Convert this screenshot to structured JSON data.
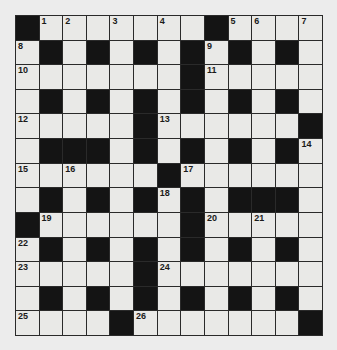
{
  "puzzle": {
    "rows": 13,
    "cols": 13,
    "colors": {
      "background": "#ececec",
      "cell": "#e9e9e7",
      "block": "#141414",
      "line": "#2a2a2a"
    },
    "grid": [
      [
        "#",
        "1",
        "2",
        "",
        "3",
        "",
        "4",
        "",
        "#",
        "5",
        "6",
        "",
        "7"
      ],
      [
        "8",
        "#",
        "",
        "#",
        "",
        "#",
        "",
        "#",
        "9",
        "#",
        "",
        "#",
        ""
      ],
      [
        "10",
        "",
        "",
        "",
        "",
        "",
        "",
        "#",
        "11",
        "",
        "",
        "",
        ""
      ],
      [
        "",
        "#",
        "",
        "#",
        "",
        "#",
        "",
        "#",
        "",
        "#",
        "",
        "#",
        ""
      ],
      [
        "12",
        "",
        "",
        "",
        "",
        "#",
        "13",
        "",
        "",
        "",
        "",
        "",
        "#"
      ],
      [
        "",
        "#",
        "#",
        "#",
        "",
        "#",
        "",
        "#",
        "",
        "#",
        "",
        "#",
        "14"
      ],
      [
        "15",
        "",
        "16",
        "",
        "",
        "",
        "#",
        "17",
        "",
        "",
        "",
        "",
        ""
      ],
      [
        "",
        "#",
        "",
        "#",
        "",
        "#",
        "18",
        "#",
        "",
        "#",
        "#",
        "#",
        ""
      ],
      [
        "#",
        "19",
        "",
        "",
        "",
        "",
        "",
        "#",
        "20",
        "",
        "21",
        "",
        ""
      ],
      [
        "22",
        "#",
        "",
        "#",
        "",
        "#",
        "",
        "#",
        "",
        "#",
        "",
        "#",
        ""
      ],
      [
        "23",
        "",
        "",
        "",
        "",
        "#",
        "24",
        "",
        "",
        "",
        "",
        "",
        ""
      ],
      [
        "",
        "#",
        "",
        "#",
        "",
        "#",
        "",
        "#",
        "",
        "#",
        "",
        "#",
        ""
      ],
      [
        "25",
        "",
        "",
        "",
        "#",
        "26",
        "",
        "",
        "",
        "",
        "",
        "",
        "#"
      ]
    ]
  }
}
